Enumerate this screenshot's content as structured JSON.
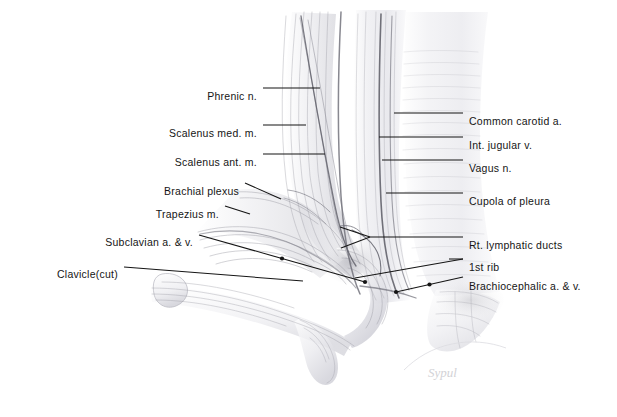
{
  "figure": {
    "background_color": "#ffffff",
    "ink_color": "#151515",
    "pencil_color": "#9a9aa2",
    "width": 617,
    "height": 417
  },
  "labels_left": [
    {
      "id": "phrenic-nerve",
      "text": "Phrenic n.",
      "tx": 257,
      "ty": 91,
      "lx1": 263,
      "ly1": 88,
      "lx2": 320,
      "ly2": 88,
      "marker": "none"
    },
    {
      "id": "scalenus-medius",
      "text": "Scalenus med. m.",
      "tx": 257,
      "ty": 128,
      "lx1": 263,
      "ly1": 125,
      "lx2": 306,
      "ly2": 125,
      "marker": "none"
    },
    {
      "id": "scalenus-anterior",
      "text": "Scalenus ant. m.",
      "tx": 257,
      "ty": 157,
      "lx1": 263,
      "ly1": 154,
      "lx2": 325,
      "ly2": 154,
      "marker": "none"
    },
    {
      "id": "brachial-plexus",
      "text": "Brachial plexus",
      "tx": 239,
      "ty": 186,
      "lx1": 245,
      "ly1": 183,
      "lx2": 281,
      "ly2": 199,
      "marker": "none"
    },
    {
      "id": "trapezius",
      "text": "Trapezius m.",
      "tx": 219,
      "ty": 209,
      "lx1": 225,
      "ly1": 206,
      "lx2": 250,
      "ly2": 214,
      "marker": "none"
    },
    {
      "id": "subclavian-vessels",
      "text": "Subclavian a. & v.",
      "tx": 193,
      "ty": 237,
      "lx1": 199,
      "ly1": 235,
      "lx2": 365,
      "ly2": 282,
      "marker": "mid-dot"
    },
    {
      "id": "clavicle-cut",
      "text": "Clavicle(cut)",
      "tx": 118,
      "ty": 269,
      "lx1": 124,
      "ly1": 267,
      "lx2": 303,
      "ly2": 281,
      "marker": "none"
    }
  ],
  "labels_right": [
    {
      "id": "common-carotid",
      "text": "Common carotid a.",
      "tx": 469,
      "ty": 116,
      "lx1": 394,
      "ly1": 113,
      "lx2": 463,
      "ly2": 113,
      "marker": "none"
    },
    {
      "id": "internal-jugular",
      "text": "Int. jugular v.",
      "tx": 469,
      "ty": 140,
      "lx1": 379,
      "ly1": 137,
      "lx2": 463,
      "ly2": 137,
      "marker": "none"
    },
    {
      "id": "vagus-nerve",
      "text": "Vagus n.",
      "tx": 469,
      "ty": 163,
      "lx1": 382,
      "ly1": 160,
      "lx2": 463,
      "ly2": 160,
      "marker": "none"
    },
    {
      "id": "cupola-pleura",
      "text": "Cupola of pleura",
      "tx": 469,
      "ty": 196,
      "lx1": 386,
      "ly1": 193,
      "lx2": 463,
      "ly2": 193,
      "marker": "none"
    },
    {
      "id": "rt-lymphatic-ducts",
      "text": "Rt. lymphatic ducts",
      "tx": 469,
      "ty": 240,
      "lx1": 370,
      "ly1": 237,
      "lx2": 463,
      "ly2": 237,
      "marker": "fork"
    },
    {
      "id": "first-rib",
      "text": "1st rib",
      "tx": 469,
      "ty": 262,
      "lx1": 449,
      "ly1": 259,
      "lx2": 463,
      "ly2": 259,
      "marker": "none"
    },
    {
      "id": "brachiocephalic",
      "text": "Brachiocephalic a. & v.",
      "tx": 469,
      "ty": 281,
      "lx1": 396,
      "ly1": 292,
      "lx2": 463,
      "ly2": 277,
      "marker": "two-dots"
    }
  ],
  "fork": {
    "apex_x": 370,
    "apex_y": 237,
    "tip1_x": 340,
    "tip1_y": 227,
    "tip2_x": 341,
    "tip2_y": 248
  },
  "rt_lymph_second_leader": {
    "x1": 355,
    "y1": 278,
    "x2": 463,
    "y2": 259
  },
  "signature": {
    "text": "Sypul",
    "x": 428,
    "y": 365
  }
}
